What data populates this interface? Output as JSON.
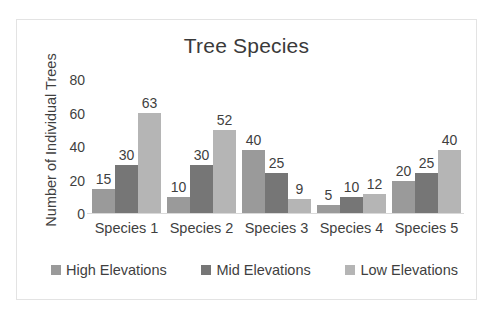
{
  "chart_data": {
    "type": "bar",
    "title": "Tree Species",
    "xlabel": "",
    "ylabel": "Number of Individual Trees",
    "categories": [
      "Species 1",
      "Species 2",
      "Species 3",
      "Species 4",
      "Species 5"
    ],
    "series": [
      {
        "name": "High Elevations",
        "color": "#9a9a9a",
        "values": [
          15,
          10,
          40,
          5,
          20
        ]
      },
      {
        "name": "Mid Elevations",
        "color": "#767676",
        "values": [
          30,
          30,
          25,
          10,
          25
        ]
      },
      {
        "name": "Low Elevations",
        "color": "#b5b5b5",
        "values": [
          63,
          52,
          9,
          12,
          40
        ]
      }
    ],
    "ylim": [
      0,
      80
    ],
    "yticks": [
      0,
      20,
      40,
      60,
      80
    ],
    "ytick_labels": [
      "0",
      "20",
      "40",
      "60",
      "80"
    ],
    "grid": false,
    "legend_position": "bottom",
    "data_labels": true
  },
  "frame": {
    "border_color": "#e3e3e3"
  }
}
